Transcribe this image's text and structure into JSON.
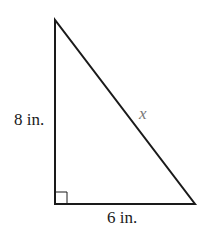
{
  "figure": {
    "type": "right-triangle",
    "colors": {
      "stroke": "#1a1a1a",
      "variable": "#777777",
      "background": "#ffffff"
    },
    "vertices": {
      "top": [
        55,
        20
      ],
      "right_angle": [
        55,
        204
      ],
      "bottom_right": [
        195,
        204
      ]
    },
    "labels": {
      "vertical_leg": "8 in.",
      "horizontal_leg": "6 in.",
      "hypotenuse": "x"
    },
    "right_angle_marker": true
  }
}
